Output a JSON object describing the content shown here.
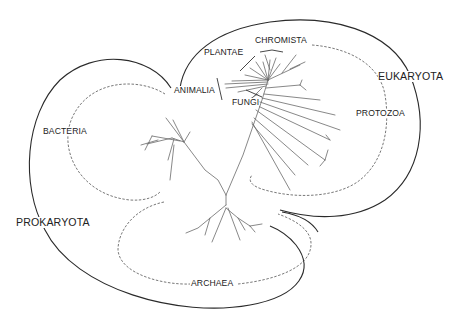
{
  "diagram": {
    "type": "phylogenetic-tree",
    "domains": {
      "prokaryota": "PROKARYOTA",
      "eukaryota": "EUKARYOTA"
    },
    "groups": {
      "bacteria": "BACTERIA",
      "archaea": "ARCHAEA",
      "protozoa": "PROTOZOA",
      "chromista": "CHROMISTA",
      "plantae": "PLANTAE",
      "animalia": "ANIMALIA",
      "fungi": "FUNGI"
    },
    "colors": {
      "outline": "#2a2a2a",
      "dashed": "#555555",
      "branches": "#6a6a6a",
      "background": "#ffffff"
    }
  }
}
